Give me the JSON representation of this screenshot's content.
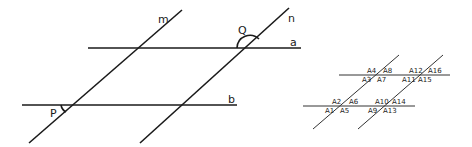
{
  "main_diagram": {
    "lines": {
      "m": "m",
      "n": "n",
      "a": "a",
      "b": "b"
    },
    "angles": {
      "Q": "Q",
      "P": "P"
    }
  },
  "angle_diagram": {
    "upper_left": [
      "A4",
      "A8",
      "A3",
      "A7"
    ],
    "upper_right": [
      "A12",
      "A16",
      "A11",
      "A15"
    ],
    "lower_left": [
      "A2",
      "A6",
      "A1",
      "A5"
    ],
    "lower_right": [
      "A10",
      "A14",
      "A9",
      "A13"
    ]
  },
  "colors": {
    "line": "#1a1a1a",
    "background": "#ffffff"
  }
}
